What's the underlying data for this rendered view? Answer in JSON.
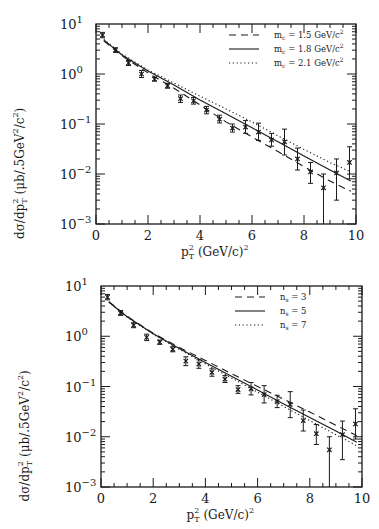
{
  "chart_data": [
    {
      "type": "scatter",
      "panel": "top",
      "title": "",
      "xlabel": "p_T^2 (GeV/c)^2",
      "ylabel": "dσ/dp_T^2 (μb/.5GeV^2/c^2)",
      "xlim": [
        0,
        10
      ],
      "ylim": [
        0.001,
        10
      ],
      "yscale": "log",
      "grid": false,
      "legend_position": "upper right",
      "x_ticks": [
        "0",
        "2",
        "4",
        "6",
        "8",
        "10"
      ],
      "y_ticks": [
        "10^1",
        "10^0",
        "10^-1",
        "10^-2",
        "10^-3"
      ],
      "data_points": {
        "name": "data",
        "marker": "x",
        "x": [
          0.25,
          0.75,
          1.25,
          1.75,
          2.25,
          2.75,
          3.25,
          3.75,
          4.25,
          4.75,
          5.25,
          5.75,
          6.25,
          6.75,
          7.25,
          7.75,
          8.25,
          8.75,
          9.25,
          9.75
        ],
        "y": [
          6.0,
          3.0,
          1.66,
          1.0,
          0.79,
          0.58,
          0.32,
          0.29,
          0.19,
          0.125,
          0.083,
          0.087,
          0.069,
          0.048,
          0.044,
          0.02,
          0.011,
          0.0053,
          0.0105,
          0.017
        ],
        "err_lo": [
          0.7,
          0.3,
          0.18,
          0.15,
          0.07,
          0.06,
          0.05,
          0.04,
          0.03,
          0.02,
          0.014,
          0.022,
          0.022,
          0.012,
          0.02,
          0.008,
          0.0045,
          0.0053,
          0.0075,
          0.009
        ],
        "err_hi": [
          0.8,
          0.35,
          0.2,
          0.18,
          0.08,
          0.07,
          0.06,
          0.05,
          0.035,
          0.025,
          0.017,
          0.03,
          0.035,
          0.017,
          0.035,
          0.013,
          0.006,
          0.0047,
          0.0095,
          0.018
        ]
      },
      "series": [
        {
          "name": "m_c = 1.5 GeV/c^2",
          "style": "dashed",
          "x": [
            0.3,
            1,
            2,
            3,
            4,
            5,
            6,
            7,
            8,
            9,
            9.8
          ],
          "y": [
            4.6,
            2.3,
            1.05,
            0.52,
            0.24,
            0.11,
            0.055,
            0.028,
            0.014,
            0.0072,
            0.0045
          ]
        },
        {
          "name": "m_c = 1.8 GeV/c^2",
          "style": "solid",
          "x": [
            0.3,
            1,
            2,
            3,
            4,
            5,
            6,
            7,
            8,
            9,
            9.8
          ],
          "y": [
            4.8,
            2.4,
            1.15,
            0.6,
            0.3,
            0.16,
            0.084,
            0.044,
            0.023,
            0.012,
            0.0072
          ]
        },
        {
          "name": "m_c = 2.1 GeV/c^2",
          "style": "dotted",
          "x": [
            0.3,
            1,
            2,
            3,
            4,
            5,
            6,
            7,
            8,
            9,
            9.8
          ],
          "y": [
            4.9,
            2.5,
            1.2,
            0.66,
            0.36,
            0.2,
            0.11,
            0.058,
            0.031,
            0.017,
            0.011
          ]
        }
      ]
    },
    {
      "type": "scatter",
      "panel": "bottom",
      "title": "",
      "xlabel": "p_T^2 (GeV/c)^2",
      "ylabel": "dσ/dp_T^2 (μb/.5GeV^2/c^2)",
      "xlim": [
        0,
        10
      ],
      "ylim": [
        0.001,
        10
      ],
      "yscale": "log",
      "grid": false,
      "legend_position": "upper right",
      "x_ticks": [
        "0",
        "2",
        "4",
        "6",
        "8",
        "10"
      ],
      "y_ticks": [
        "10^1",
        "10^0",
        "10^-1",
        "10^-2",
        "10^-3"
      ],
      "data_points": {
        "name": "data",
        "marker": "x",
        "x": [
          0.25,
          0.75,
          1.25,
          1.75,
          2.25,
          2.75,
          3.25,
          3.75,
          4.25,
          4.75,
          5.25,
          5.75,
          6.25,
          6.75,
          7.25,
          7.75,
          8.25,
          8.75,
          9.25,
          9.75
        ],
        "y": [
          6.0,
          2.9,
          1.66,
          0.95,
          0.76,
          0.55,
          0.32,
          0.28,
          0.19,
          0.14,
          0.087,
          0.09,
          0.069,
          0.05,
          0.044,
          0.021,
          0.0115,
          0.0055,
          0.011,
          0.018
        ],
        "err_lo": [
          0.7,
          0.3,
          0.18,
          0.13,
          0.07,
          0.06,
          0.06,
          0.05,
          0.03,
          0.02,
          0.014,
          0.022,
          0.022,
          0.012,
          0.02,
          0.008,
          0.0045,
          0.0055,
          0.0075,
          0.009
        ],
        "err_hi": [
          0.8,
          0.35,
          0.2,
          0.15,
          0.08,
          0.07,
          0.07,
          0.06,
          0.035,
          0.025,
          0.017,
          0.03,
          0.035,
          0.017,
          0.035,
          0.013,
          0.006,
          0.0045,
          0.0095,
          0.018
        ]
      },
      "series": [
        {
          "name": "n_s = 3",
          "style": "dashed",
          "x": [
            0.3,
            1,
            2,
            3,
            4,
            5,
            6,
            7,
            8,
            9,
            9.8
          ],
          "y": [
            4.9,
            2.5,
            1.15,
            0.6,
            0.33,
            0.18,
            0.1,
            0.056,
            0.031,
            0.017,
            0.0105
          ]
        },
        {
          "name": "n_s = 5",
          "style": "solid",
          "x": [
            0.3,
            1,
            2,
            3,
            4,
            5,
            6,
            7,
            8,
            9,
            9.8
          ],
          "y": [
            4.8,
            2.45,
            1.12,
            0.57,
            0.3,
            0.16,
            0.085,
            0.045,
            0.024,
            0.013,
            0.0078
          ]
        },
        {
          "name": "n_s = 7",
          "style": "dotted",
          "x": [
            0.3,
            1,
            2,
            3,
            4,
            5,
            6,
            7,
            8,
            9,
            9.8
          ],
          "y": [
            4.75,
            2.4,
            1.1,
            0.55,
            0.28,
            0.148,
            0.077,
            0.04,
            0.021,
            0.011,
            0.0066
          ]
        }
      ]
    }
  ],
  "figure": {
    "panels": [
      {
        "legend": [
          {
            "style": "dashed",
            "sym": "m",
            "sub": "c",
            "rest": " = 1.5 GeV/c",
            "sup": "2"
          },
          {
            "style": "solid",
            "sym": "m",
            "sub": "c",
            "rest": " = 1.8 GeV/c",
            "sup": "2"
          },
          {
            "style": "dotted",
            "sym": "m",
            "sub": "c",
            "rest": " = 2.1 GeV/c",
            "sup": "2"
          }
        ]
      },
      {
        "legend": [
          {
            "style": "dashed",
            "sym": "n",
            "sub": "s",
            "rest": " = 3",
            "sup": ""
          },
          {
            "style": "solid",
            "sym": "n",
            "sub": "s",
            "rest": " = 5",
            "sup": ""
          },
          {
            "style": "dotted",
            "sym": "n",
            "sub": "s",
            "rest": " = 7",
            "sup": ""
          }
        ]
      }
    ],
    "x_tick_labels": [
      "0",
      "2",
      "4",
      "6",
      "8",
      "10"
    ],
    "y_tick_exponents": [
      "1",
      "0",
      "−1",
      "−2",
      "−3"
    ],
    "xlabel": {
      "base": "p",
      "sup": "2",
      "sub": "T",
      "rest": " (GeV/c)",
      "rest_sup": "2"
    },
    "ylabel": {
      "text1": "dσ/dp",
      "sup1": "2",
      "sub1": "T",
      "text2": " (μb/.5GeV",
      "sup2": "2",
      "text3": "/c",
      "sup3": "2",
      "text4": ")"
    },
    "ink_color": "#1a1a1a"
  }
}
